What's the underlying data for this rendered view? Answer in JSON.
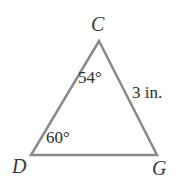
{
  "figure": {
    "type": "triangle-geometry-diagram",
    "background_color": "#ffffff",
    "stroke_color": "#8a8a8a",
    "stroke_width": 2.5,
    "label_color": "#3a3a3a",
    "measure_color": "#2e2e2e"
  },
  "vertices": {
    "apex": {
      "label": "C",
      "x": 99,
      "y": 41
    },
    "bottom_left": {
      "label": "D",
      "x": 31,
      "y": 155
    },
    "bottom_right": {
      "label": "G",
      "x": 157,
      "y": 155
    }
  },
  "angles": {
    "at_C": "54°",
    "at_D": "60°"
  },
  "sides": {
    "CG": "3 in."
  }
}
